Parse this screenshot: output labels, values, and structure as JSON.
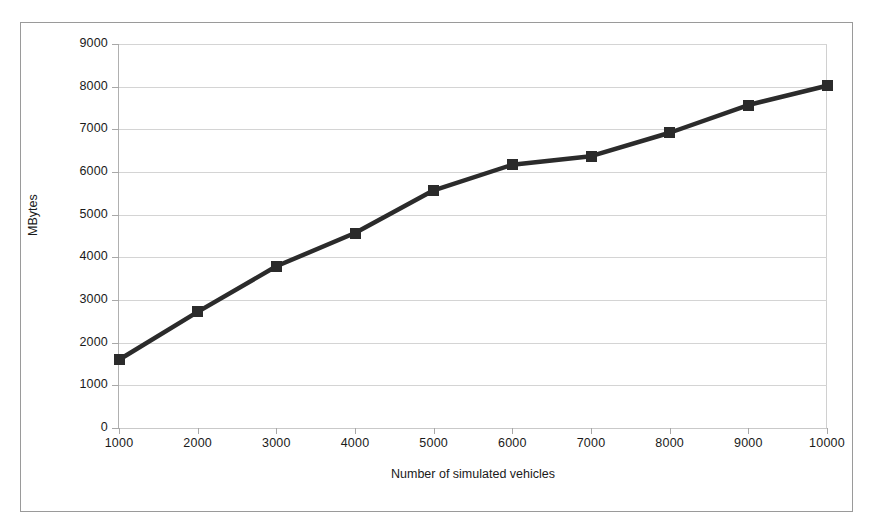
{
  "chart_data": {
    "type": "line",
    "title": "",
    "subtitle": "",
    "xlabel": "Number of simulated vehicles",
    "ylabel": "MBytes",
    "x": [
      1000,
      2000,
      3000,
      4000,
      5000,
      6000,
      7000,
      8000,
      9000,
      10000
    ],
    "values": [
      1600,
      2720,
      3790,
      4570,
      5570,
      6170,
      6370,
      6920,
      7570,
      8020
    ],
    "series": [
      {
        "name": "MBytes",
        "values": [
          1600,
          2720,
          3790,
          4570,
          5570,
          6170,
          6370,
          6920,
          7570,
          8020
        ]
      }
    ],
    "xlim": [
      1000,
      10000
    ],
    "ylim": [
      0,
      9000
    ],
    "y_ticks": [
      0,
      1000,
      2000,
      3000,
      4000,
      5000,
      6000,
      7000,
      8000,
      9000
    ],
    "y_tick_labels": [
      "0",
      "1000",
      "2000",
      "3000",
      "4000",
      "5000",
      "6000",
      "7000",
      "8000",
      "9000"
    ],
    "x_ticks": [
      1000,
      2000,
      3000,
      4000,
      5000,
      6000,
      7000,
      8000,
      9000,
      10000
    ],
    "x_tick_labels": [
      "1000",
      "2000",
      "3000",
      "4000",
      "5000",
      "6000",
      "7000",
      "8000",
      "9000",
      "10000"
    ],
    "grid": "horizontal",
    "legend": "none",
    "marker": "square",
    "series_color": "#2b2b2b",
    "grid_color": "#d4d4d4",
    "axis_color": "#a8a8a8",
    "frame_color": "#9a9a9a",
    "background": "#ffffff"
  }
}
